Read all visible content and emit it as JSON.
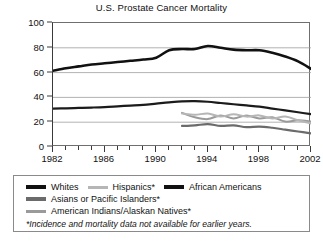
{
  "chart_data": {
    "type": "line",
    "title": "U.S. Prostate Cancer Mortality",
    "xlabel": "",
    "ylabel": "Mortality per 100,000 Men",
    "xlim": [
      1982,
      2002
    ],
    "ylim": [
      0,
      100
    ],
    "yticks": [
      0,
      20,
      40,
      60,
      80,
      100
    ],
    "xticks": [
      1982,
      1983,
      1984,
      1985,
      1986,
      1987,
      1988,
      1989,
      1990,
      1991,
      1992,
      1993,
      1994,
      1995,
      1996,
      1997,
      1998,
      1999,
      2000,
      2001,
      2002
    ],
    "xtick_labels": [
      1982,
      1986,
      1990,
      1994,
      1998,
      2002
    ],
    "grid": "horizontal",
    "legend_position": "below-plot",
    "series": [
      {
        "name": "African Americans",
        "color": "#111111",
        "width": 2.6,
        "x": [
          1982,
          1983,
          1984,
          1985,
          1986,
          1987,
          1988,
          1989,
          1990,
          1991,
          1992,
          1993,
          1994,
          1995,
          1996,
          1997,
          1998,
          1999,
          2000,
          2001,
          2002
        ],
        "values": [
          61.5,
          63.5,
          65.0,
          66.5,
          67.5,
          68.5,
          69.5,
          70.5,
          72.0,
          78.0,
          79.0,
          79.0,
          81.5,
          80.0,
          78.5,
          78.0,
          78.0,
          76.0,
          73.0,
          69.0,
          63.0
        ]
      },
      {
        "name": "Whites",
        "color": "#1b1b1b",
        "width": 2.2,
        "x": [
          1982,
          1983,
          1984,
          1985,
          1986,
          1987,
          1988,
          1989,
          1990,
          1991,
          1992,
          1993,
          1994,
          1995,
          1996,
          1997,
          1998,
          1999,
          2000,
          2001,
          2002
        ],
        "values": [
          31.0,
          31.2,
          31.5,
          31.8,
          32.2,
          32.8,
          33.4,
          34.0,
          35.0,
          36.0,
          36.8,
          37.0,
          36.5,
          35.5,
          34.5,
          33.5,
          32.5,
          31.0,
          29.5,
          28.0,
          26.5
        ]
      },
      {
        "name": "Hispanics*",
        "color": "#b6b6b6",
        "width": 2.0,
        "x": [
          1992,
          1993,
          1994,
          1995,
          1996,
          1997,
          1998,
          1999,
          2000,
          2001,
          2002
        ],
        "values": [
          27.0,
          26.0,
          27.0,
          24.5,
          26.5,
          24.5,
          25.5,
          23.0,
          24.5,
          21.5,
          19.0
        ]
      },
      {
        "name": "Asians or Pacific Islanders*",
        "color": "#6b6b6b",
        "width": 2.2,
        "x": [
          1992,
          1993,
          1994,
          1995,
          1996,
          1997,
          1998,
          1999,
          2000,
          2001,
          2002
        ],
        "values": [
          17.0,
          17.5,
          18.5,
          17.0,
          17.5,
          16.0,
          16.5,
          15.5,
          14.0,
          12.5,
          11.0
        ]
      },
      {
        "name": "American Indians/Alaskan Natives*",
        "color": "#9a9a9a",
        "width": 2.0,
        "x": [
          1992,
          1993,
          1994,
          1995,
          1996,
          1997,
          1998,
          1999,
          2000,
          2001,
          2002
        ],
        "values": [
          27.5,
          24.0,
          22.5,
          25.5,
          23.0,
          25.5,
          23.0,
          24.0,
          20.5,
          21.5,
          20.5
        ]
      }
    ]
  },
  "legend": {
    "rows": [
      [
        {
          "label": "Whites",
          "color": "#111111",
          "thickness": 3.4
        },
        {
          "label": "Hispanics*",
          "color": "#b6b6b6",
          "thickness": 3.0
        },
        {
          "label": "African Americans",
          "color": "#111111",
          "thickness": 3.6
        }
      ],
      [
        {
          "label": "Asians or Pacific Islanders*",
          "color": "#6b6b6b",
          "thickness": 3.2
        }
      ],
      [
        {
          "label": "American Indians/Alaskan Natives*",
          "color": "#9a9a9a",
          "thickness": 3.0
        }
      ]
    ],
    "note": "*Incidence and mortality data not available for earlier years."
  }
}
